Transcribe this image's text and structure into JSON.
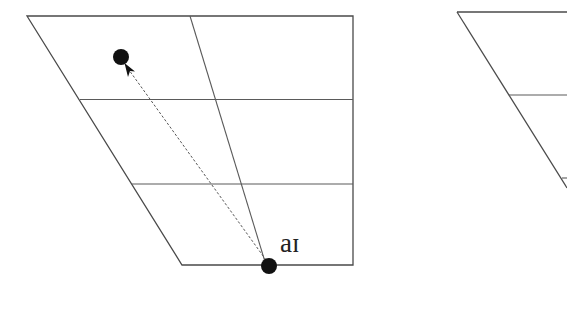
{
  "diagrams": [
    {
      "name": "vowel-trapezoid-left",
      "trapezoid": {
        "top_left": [
          27,
          16
        ],
        "top_right": [
          353,
          16
        ],
        "bottom_right": [
          353,
          265
        ],
        "bottom_left": [
          182,
          265
        ]
      },
      "horizontal_lines": [
        {
          "x1": 80,
          "y": 99.5,
          "x2": 353
        },
        {
          "x1": 132,
          "y": 184,
          "x2": 353
        }
      ],
      "center_line": {
        "x1": 190,
        "y1": 16,
        "x2": 266,
        "y2": 265
      },
      "start_point": {
        "cx": 269,
        "cy": 266,
        "r": 8
      },
      "end_point": {
        "cx": 121,
        "cy": 57,
        "r": 8
      },
      "arrow": {
        "from": [
          266,
          260
        ],
        "to": [
          127,
          67
        ],
        "style": "dashed"
      },
      "label": {
        "text": "aɪ",
        "x": 280,
        "y": 252
      },
      "colors": {
        "line": "#4a4a4a",
        "dot": "#111111",
        "text": "#222222"
      }
    },
    {
      "name": "vowel-trapezoid-right-partial",
      "trapezoid": {
        "top_left": [
          457,
          12
        ],
        "top_right": [
          567,
          12
        ],
        "left_edge_bottom": [
          567,
          185
        ]
      },
      "horizontal_lines": [
        {
          "x1": 509,
          "y": 95,
          "x2": 567
        },
        {
          "x1": 562,
          "y": 178,
          "x2": 567
        }
      ]
    }
  ]
}
